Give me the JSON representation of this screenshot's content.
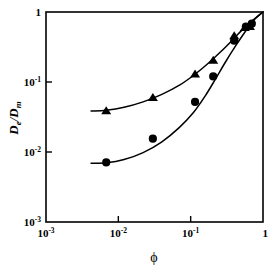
{
  "chart_data": {
    "type": "scatter",
    "title": "",
    "xlabel": "ϕ",
    "ylabel": "De/Dm",
    "ylabel_parts": {
      "numerator": "D",
      "numerator_sub": "e",
      "denominator": "D",
      "denominator_sub": "m"
    },
    "xscale": "log",
    "yscale": "log",
    "xlim": [
      0.001,
      1
    ],
    "ylim": [
      0.001,
      1
    ],
    "grid": false,
    "legend": "none",
    "xticks": [
      {
        "value": 0.001,
        "label": "10",
        "exponent": "-3"
      },
      {
        "value": 0.01,
        "label": "10",
        "exponent": "-2"
      },
      {
        "value": 0.1,
        "label": "10",
        "exponent": "-1"
      },
      {
        "value": 1,
        "label": "1",
        "exponent": ""
      }
    ],
    "yticks": [
      {
        "value": 1,
        "label": "1",
        "exponent": ""
      },
      {
        "value": 0.1,
        "label": "10",
        "exponent": "-1"
      },
      {
        "value": 0.01,
        "label": "10",
        "exponent": "-2"
      },
      {
        "value": 0.001,
        "label": "10",
        "exponent": "-3"
      }
    ],
    "series": [
      {
        "name": "upper-series",
        "marker": "triangle",
        "color": "#000000",
        "points": [
          {
            "x": 0.0068,
            "y": 0.039
          },
          {
            "x": 0.03,
            "y": 0.06
          },
          {
            "x": 0.115,
            "y": 0.13
          },
          {
            "x": 0.205,
            "y": 0.205
          },
          {
            "x": 0.4,
            "y": 0.46
          },
          {
            "x": 0.56,
            "y": 0.6
          },
          {
            "x": 0.66,
            "y": 0.62
          }
        ],
        "fit_curve": [
          {
            "x": 0.0042,
            "y": 0.0385
          },
          {
            "x": 0.0068,
            "y": 0.0395
          },
          {
            "x": 0.012,
            "y": 0.0435
          },
          {
            "x": 0.022,
            "y": 0.052
          },
          {
            "x": 0.04,
            "y": 0.0665
          },
          {
            "x": 0.07,
            "y": 0.09
          },
          {
            "x": 0.115,
            "y": 0.129
          },
          {
            "x": 0.175,
            "y": 0.185
          },
          {
            "x": 0.26,
            "y": 0.27
          },
          {
            "x": 0.38,
            "y": 0.4
          },
          {
            "x": 0.52,
            "y": 0.56
          },
          {
            "x": 0.7,
            "y": 0.74
          },
          {
            "x": 1.0,
            "y": 1.0
          }
        ]
      },
      {
        "name": "lower-series",
        "marker": "circle",
        "color": "#000000",
        "points": [
          {
            "x": 0.0068,
            "y": 0.0071
          },
          {
            "x": 0.03,
            "y": 0.0155
          },
          {
            "x": 0.115,
            "y": 0.052
          },
          {
            "x": 0.205,
            "y": 0.12
          },
          {
            "x": 0.4,
            "y": 0.39
          },
          {
            "x": 0.58,
            "y": 0.62
          },
          {
            "x": 0.7,
            "y": 0.68
          }
        ],
        "fit_curve": [
          {
            "x": 0.0042,
            "y": 0.0069
          },
          {
            "x": 0.0068,
            "y": 0.007
          },
          {
            "x": 0.012,
            "y": 0.0078
          },
          {
            "x": 0.022,
            "y": 0.0098
          },
          {
            "x": 0.04,
            "y": 0.014
          },
          {
            "x": 0.07,
            "y": 0.0225
          },
          {
            "x": 0.11,
            "y": 0.037
          },
          {
            "x": 0.16,
            "y": 0.064
          },
          {
            "x": 0.22,
            "y": 0.11
          },
          {
            "x": 0.3,
            "y": 0.19
          },
          {
            "x": 0.42,
            "y": 0.33
          },
          {
            "x": 0.58,
            "y": 0.54
          },
          {
            "x": 0.78,
            "y": 0.8
          },
          {
            "x": 1.0,
            "y": 1.0
          }
        ]
      }
    ]
  }
}
